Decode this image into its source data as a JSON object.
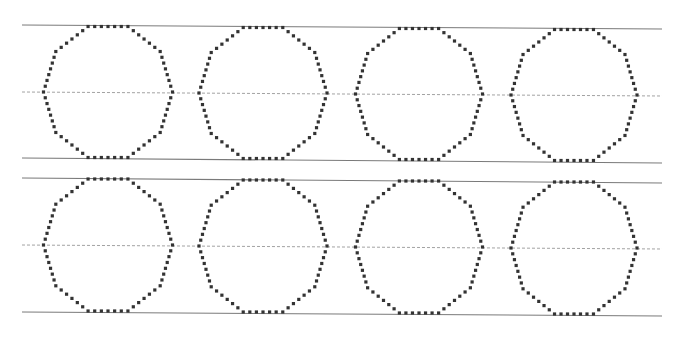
{
  "worksheet": {
    "type": "shape-tracing",
    "shape": "decagon",
    "shape_count": 8,
    "rows": 2,
    "shapes_per_row": 4
  },
  "colors": {
    "background": "#ffffff",
    "solid_line": "#7a7a7a",
    "dashed_line": "#8a8a8a",
    "dots": "#333333"
  },
  "rows": [
    {
      "top_line": {
        "x1": 22,
        "y1": 25,
        "x2": 662,
        "y2": 29
      },
      "mid_line": {
        "x1": 22,
        "y1": 92,
        "x2": 662,
        "y2": 96
      },
      "bottom_line": {
        "x1": 22,
        "y1": 158,
        "x2": 662,
        "y2": 163
      },
      "shapes": [
        {
          "cx": 108,
          "cy": 92,
          "w": 129,
          "h": 131
        },
        {
          "cx": 263,
          "cy": 93,
          "w": 128,
          "h": 131
        },
        {
          "cx": 419,
          "cy": 94,
          "w": 127,
          "h": 131
        },
        {
          "cx": 574,
          "cy": 95,
          "w": 126,
          "h": 131
        }
      ]
    },
    {
      "top_line": {
        "x1": 22,
        "y1": 178,
        "x2": 662,
        "y2": 183
      },
      "mid_line": {
        "x1": 22,
        "y1": 245,
        "x2": 662,
        "y2": 249
      },
      "bottom_line": {
        "x1": 22,
        "y1": 312,
        "x2": 662,
        "y2": 316
      },
      "shapes": [
        {
          "cx": 108,
          "cy": 245,
          "w": 129,
          "h": 132
        },
        {
          "cx": 263,
          "cy": 246,
          "w": 128,
          "h": 132
        },
        {
          "cx": 419,
          "cy": 247,
          "w": 127,
          "h": 132
        },
        {
          "cx": 574,
          "cy": 248,
          "w": 126,
          "h": 132
        }
      ]
    }
  ]
}
